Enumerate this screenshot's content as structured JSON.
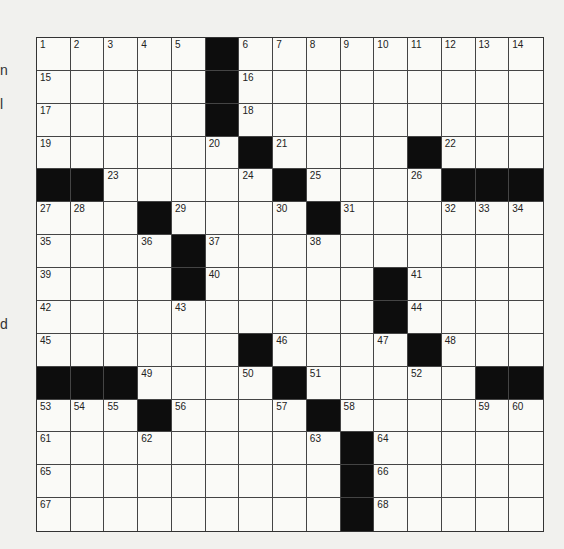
{
  "edge_text_fragments": [
    {
      "text": "n",
      "top": 62
    },
    {
      "text": "l",
      "top": 96
    },
    {
      "text": "d",
      "top": 316
    }
  ],
  "puzzle": {
    "rows": 15,
    "cols": 15,
    "grid": [
      [
        "1",
        "2",
        "3",
        "4",
        "5",
        "#",
        "6",
        "7",
        "8",
        "9",
        "10",
        "11",
        "12",
        "13",
        "14"
      ],
      [
        "15",
        "",
        "",
        "",
        "",
        "#",
        "16",
        "",
        "",
        "",
        "",
        "",
        "",
        "",
        ""
      ],
      [
        "17",
        "",
        "",
        "",
        "",
        "#",
        "18",
        "",
        "",
        "",
        "",
        "",
        "",
        "",
        ""
      ],
      [
        "19",
        "",
        "",
        "",
        "",
        "20",
        "#",
        "21",
        "",
        "",
        "",
        "#",
        "22",
        "",
        ""
      ],
      [
        "#",
        "#",
        "23",
        "",
        "",
        "",
        "24",
        "#",
        "25",
        "",
        "",
        "26",
        "#",
        "#",
        "#"
      ],
      [
        "27",
        "28",
        "",
        "#",
        "29",
        "",
        "",
        "30",
        "#",
        "31",
        "",
        "",
        "32",
        "33",
        "34"
      ],
      [
        "35",
        "",
        "",
        "36",
        "#",
        "37",
        "",
        "",
        "38",
        "",
        "",
        "",
        "",
        "",
        ""
      ],
      [
        "39",
        "",
        "",
        "",
        "#",
        "40",
        "",
        "",
        "",
        "",
        "#",
        "41",
        "",
        "",
        ""
      ],
      [
        "42",
        "",
        "",
        "",
        "43",
        "",
        "",
        "",
        "",
        "",
        "#",
        "44",
        "",
        "",
        ""
      ],
      [
        "45",
        "",
        "",
        "",
        "",
        "",
        "#",
        "46",
        "",
        "",
        "47",
        "#",
        "48",
        "",
        ""
      ],
      [
        "#",
        "#",
        "#",
        "49",
        "",
        "",
        "50",
        "#",
        "51",
        "",
        "",
        "52",
        "",
        "#",
        "#"
      ],
      [
        "53",
        "54",
        "55",
        "#",
        "56",
        "",
        "",
        "57",
        "#",
        "58",
        "",
        "",
        "",
        "59",
        "60"
      ],
      [
        "61",
        "",
        "",
        "62",
        "",
        "",
        "",
        "",
        "63",
        "#",
        "64",
        "",
        "",
        "",
        ""
      ],
      [
        "65",
        "",
        "",
        "",
        "",
        "",
        "",
        "",
        "",
        "#",
        "66",
        "",
        "",
        "",
        ""
      ],
      [
        "67",
        "",
        "",
        "",
        "",
        "",
        "",
        "",
        "",
        "#",
        "68",
        "",
        "",
        "",
        ""
      ]
    ],
    "colors": {
      "black_square": "#0d0d0d",
      "white_square": "#fafaf7",
      "grid_line": "#444444",
      "paper": "#f1f1ee"
    }
  }
}
